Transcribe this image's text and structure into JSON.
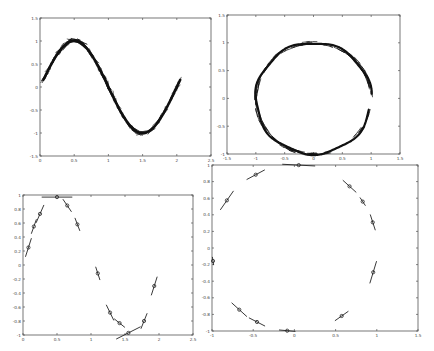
{
  "chart_data": [
    {
      "id": "top-left",
      "type": "line",
      "title": "",
      "xlabel": "",
      "ylabel": "",
      "box": {
        "x0": 40,
        "y0": 18,
        "x1": 211,
        "y1": 156
      },
      "xlim": [
        0,
        2.5
      ],
      "ylim": [
        -1.5,
        1.5
      ],
      "xticks": [
        0,
        0.5,
        1,
        1.5,
        2,
        2.5
      ],
      "xtick_labels": [
        "0",
        "0.5",
        "1",
        "1.5",
        "2",
        "2.5"
      ],
      "yticks": [
        -1.5,
        -1,
        -0.5,
        0,
        0.5,
        1,
        1.5
      ],
      "ytick_labels": [
        "-1.5",
        "-1",
        "-0.5",
        "0",
        "0.5",
        "1",
        "1.5"
      ],
      "grid": false,
      "style": "dense-tangent-segments",
      "curve": "sine",
      "x_range": [
        0.05,
        2.05
      ],
      "description": "Noisy samples of y = sin(pi x) with dense short tangent strokes, peak ~1 at x=0.5, trough ~-1 at x=1.6"
    },
    {
      "id": "top-right",
      "type": "line",
      "title": "",
      "xlabel": "",
      "ylabel": "",
      "box": {
        "x0": 227,
        "y0": 15,
        "x1": 400,
        "y1": 154
      },
      "xlim": [
        -1.5,
        1.5
      ],
      "ylim": [
        -1,
        1.5
      ],
      "xticks": [
        -1.5,
        -1,
        -0.5,
        0,
        0.5,
        1,
        1.5
      ],
      "xtick_labels": [
        "-1.5",
        "-1",
        "-0.5",
        "0",
        "0.5",
        "1",
        "1.5"
      ],
      "yticks": [
        -1,
        -0.5,
        0,
        0.5,
        1,
        1.5
      ],
      "ytick_labels": [
        "-1",
        "-0.5",
        "0",
        "0.5",
        "1",
        "1.5"
      ],
      "grid": false,
      "style": "dense-tangent-segments",
      "curve": "circle",
      "radius": 1,
      "gap_angle_deg": [
        -12,
        5
      ],
      "description": "Noisy samples on unit circle with dense tangent strokes, small gap at angle ~0 (right side)"
    },
    {
      "id": "bottom-left",
      "type": "line",
      "title": "",
      "xlabel": "",
      "ylabel": "",
      "box": {
        "x0": 23,
        "y0": 195,
        "x1": 193,
        "y1": 335
      },
      "xlim": [
        0,
        2.5
      ],
      "ylim": [
        -1,
        1
      ],
      "xticks": [
        0,
        0.5,
        1,
        1.5,
        2,
        2.5
      ],
      "xtick_labels": [
        "0",
        "0.5",
        "1",
        "1.5",
        "2",
        "2.5"
      ],
      "yticks": [
        -1,
        -0.8,
        -0.6,
        -0.4,
        -0.2,
        0,
        0.2,
        0.4,
        0.6,
        0.8,
        1
      ],
      "ytick_labels": [
        "-1",
        "-0.8",
        "-0.6",
        "-0.4",
        "-0.2",
        "0",
        "0.2",
        "0.4",
        "0.6",
        "0.8",
        "1"
      ],
      "grid": false,
      "style": "sparse-tangent-segments-with-markers",
      "points": [
        {
          "x": 0.08,
          "y": 0.25,
          "len": 0.28
        },
        {
          "x": 0.16,
          "y": 0.55,
          "len": 0.22
        },
        {
          "x": 0.25,
          "y": 0.73,
          "len": 0.28
        },
        {
          "x": 0.5,
          "y": 0.97,
          "len": 0.45
        },
        {
          "x": 0.65,
          "y": 0.85,
          "len": 0.22
        },
        {
          "x": 0.8,
          "y": 0.58,
          "len": 0.2
        },
        {
          "x": 1.1,
          "y": -0.12,
          "len": 0.2
        },
        {
          "x": 1.28,
          "y": -0.68,
          "len": 0.25
        },
        {
          "x": 1.42,
          "y": -0.83,
          "len": 0.2
        },
        {
          "x": 1.55,
          "y": -0.97,
          "len": 0.4
        },
        {
          "x": 1.78,
          "y": -0.8,
          "len": 0.24
        },
        {
          "x": 1.93,
          "y": -0.3,
          "len": 0.28
        }
      ],
      "description": "Sparse noisy samples of y = sin(pi x) with tangent line segments and circle markers"
    },
    {
      "id": "bottom-right",
      "type": "line",
      "title": "",
      "xlabel": "",
      "ylabel": "",
      "box": {
        "x0": 212,
        "y0": 165,
        "x1": 418,
        "y1": 331
      },
      "xlim": [
        -1,
        1.5
      ],
      "ylim": [
        -1,
        1
      ],
      "xticks": [
        -1,
        -0.5,
        0,
        0.5,
        1,
        1.5
      ],
      "xtick_labels": [
        "-1",
        "-0.5",
        "0",
        "0.5",
        "1",
        "1.5"
      ],
      "yticks": [
        -1,
        -0.8,
        -0.6,
        -0.4,
        -0.2,
        0,
        0.2,
        0.4,
        0.6,
        0.8,
        1
      ],
      "ytick_labels": [
        "-1",
        "-0.8",
        "-0.6",
        "-0.4",
        "-0.2",
        "0",
        "0.2",
        "0.4",
        "0.6",
        "0.8",
        "1"
      ],
      "grid": false,
      "style": "sparse-tangent-segments-with-markers",
      "points": [
        {
          "angle_deg": 87,
          "len": 0.4
        },
        {
          "angle_deg": 118,
          "len": 0.25
        },
        {
          "angle_deg": 145,
          "len": 0.28
        },
        {
          "angle_deg": 189,
          "len": 0.1
        },
        {
          "angle_deg": 228,
          "len": 0.25
        },
        {
          "angle_deg": 243,
          "len": 0.22
        },
        {
          "angle_deg": 265,
          "len": 0.2
        },
        {
          "angle_deg": 305,
          "len": 0.2
        },
        {
          "angle_deg": 343,
          "len": 0.28
        },
        {
          "angle_deg": 18,
          "len": 0.2
        },
        {
          "angle_deg": 34,
          "len": 0.12
        },
        {
          "angle_deg": 48,
          "len": 0.22
        }
      ],
      "description": "Sparse noisy samples on unit circle with tangent line segments and circle markers"
    }
  ]
}
